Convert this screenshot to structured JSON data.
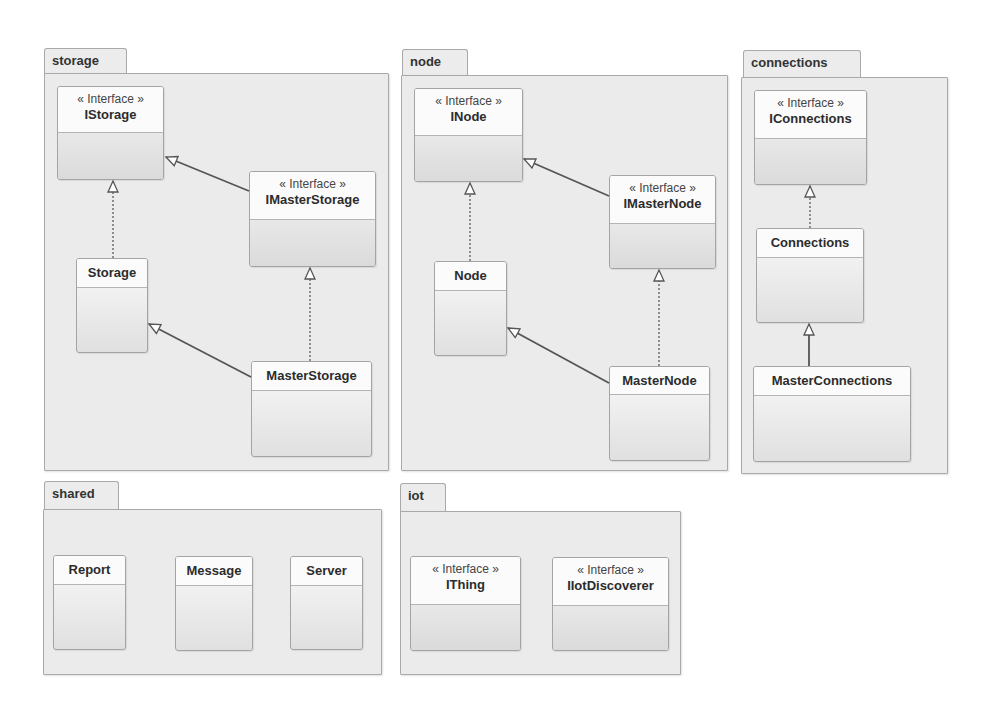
{
  "diagram": {
    "type": "UML class diagram",
    "stereotype_label": "« Interface »",
    "packages": [
      {
        "name": "storage",
        "classes": [
          {
            "name": "IStorage",
            "interface": true
          },
          {
            "name": "IMasterStorage",
            "interface": true
          },
          {
            "name": "Storage",
            "interface": false
          },
          {
            "name": "MasterStorage",
            "interface": false
          }
        ]
      },
      {
        "name": "node",
        "classes": [
          {
            "name": "INode",
            "interface": true
          },
          {
            "name": "IMasterNode",
            "interface": true
          },
          {
            "name": "Node",
            "interface": false
          },
          {
            "name": "MasterNode",
            "interface": false
          }
        ]
      },
      {
        "name": "connections",
        "classes": [
          {
            "name": "IConnections",
            "interface": true
          },
          {
            "name": "Connections",
            "interface": false
          },
          {
            "name": "MasterConnections",
            "interface": false
          }
        ]
      },
      {
        "name": "shared",
        "classes": [
          {
            "name": "Report",
            "interface": false
          },
          {
            "name": "Message",
            "interface": false
          },
          {
            "name": "Server",
            "interface": false
          }
        ]
      },
      {
        "name": "iot",
        "classes": [
          {
            "name": "IThing",
            "interface": true
          },
          {
            "name": "IIotDiscoverer",
            "interface": true
          }
        ]
      }
    ],
    "relations": [
      {
        "from": "Storage",
        "to": "IStorage",
        "kind": "realization"
      },
      {
        "from": "IMasterStorage",
        "to": "IStorage",
        "kind": "generalization"
      },
      {
        "from": "MasterStorage",
        "to": "IMasterStorage",
        "kind": "realization"
      },
      {
        "from": "MasterStorage",
        "to": "Storage",
        "kind": "generalization"
      },
      {
        "from": "Node",
        "to": "INode",
        "kind": "realization"
      },
      {
        "from": "IMasterNode",
        "to": "INode",
        "kind": "generalization"
      },
      {
        "from": "MasterNode",
        "to": "IMasterNode",
        "kind": "realization"
      },
      {
        "from": "MasterNode",
        "to": "Node",
        "kind": "generalization"
      },
      {
        "from": "Connections",
        "to": "IConnections",
        "kind": "realization"
      },
      {
        "from": "MasterConnections",
        "to": "Connections",
        "kind": "generalization"
      }
    ]
  }
}
